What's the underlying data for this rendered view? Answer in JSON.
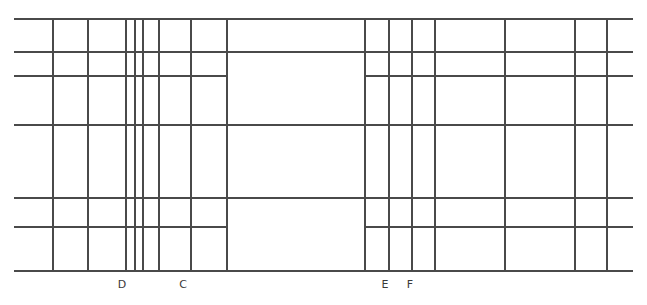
{
  "figure": {
    "width": 647,
    "height": 305,
    "background_color": "#ffffff",
    "line_color": "#4a4a4a",
    "line_color_light": "#6e6e6e",
    "label_color": "#3a3a3a"
  },
  "chart_data": {
    "type": "diagram",
    "title": "",
    "xlabel": "",
    "ylabel": "",
    "grid": true,
    "legend": false,
    "xlim": [
      0,
      647
    ],
    "ylim": [
      0,
      305
    ],
    "horizontal_lines": [
      {
        "id": "h1",
        "y": 19,
        "x_start": 14,
        "x_end": 633,
        "weight": 1.1
      },
      {
        "id": "h2",
        "y": 52,
        "x_start": 14,
        "x_end": 633,
        "weight": 1.1
      },
      {
        "id": "h3",
        "y": 76,
        "x_start": 14,
        "x_end": 227,
        "weight": 1.1
      },
      {
        "id": "h4",
        "y": 76,
        "x_start": 365,
        "x_end": 633,
        "weight": 1.1
      },
      {
        "id": "h5",
        "y": 125,
        "x_start": 14,
        "x_end": 633,
        "weight": 1.1
      },
      {
        "id": "h6",
        "y": 198,
        "x_start": 14,
        "x_end": 633,
        "weight": 1.1
      },
      {
        "id": "h7",
        "y": 227,
        "x_start": 14,
        "x_end": 227,
        "weight": 1.1
      },
      {
        "id": "h8",
        "y": 227,
        "x_start": 365,
        "x_end": 633,
        "weight": 1.1
      },
      {
        "id": "h9",
        "y": 271,
        "x_start": 14,
        "x_end": 633,
        "weight": 1.1
      }
    ],
    "vertical_lines": [
      {
        "id": "v1",
        "x": 53,
        "y_start": 19,
        "y_end": 271,
        "weight": 1.1
      },
      {
        "id": "v2",
        "x": 88,
        "y_start": 19,
        "y_end": 271,
        "weight": 1.1
      },
      {
        "id": "v3",
        "x": 126,
        "y_start": 19,
        "y_end": 271,
        "weight": 1.1
      },
      {
        "id": "v4",
        "x": 135,
        "y_start": 19,
        "y_end": 271,
        "weight": 1.1
      },
      {
        "id": "v5",
        "x": 143,
        "y_start": 19,
        "y_end": 271,
        "weight": 1.1
      },
      {
        "id": "v6",
        "x": 159,
        "y_start": 19,
        "y_end": 271,
        "weight": 1.1
      },
      {
        "id": "v7",
        "x": 191,
        "y_start": 19,
        "y_end": 271,
        "weight": 1.1
      },
      {
        "id": "v8",
        "x": 227,
        "y_start": 19,
        "y_end": 271,
        "weight": 1.1
      },
      {
        "id": "v9",
        "x": 365,
        "y_start": 19,
        "y_end": 271,
        "weight": 1.1
      },
      {
        "id": "v10",
        "x": 389,
        "y_start": 19,
        "y_end": 271,
        "weight": 1.1
      },
      {
        "id": "v11",
        "x": 412,
        "y_start": 19,
        "y_end": 271,
        "weight": 1.1
      },
      {
        "id": "v12",
        "x": 435,
        "y_start": 19,
        "y_end": 271,
        "weight": 1.1
      },
      {
        "id": "v13",
        "x": 505,
        "y_start": 19,
        "y_end": 271,
        "weight": 1.1
      },
      {
        "id": "v14",
        "x": 575,
        "y_start": 19,
        "y_end": 271,
        "weight": 1.1
      },
      {
        "id": "v15",
        "x": 607,
        "y_start": 19,
        "y_end": 271,
        "weight": 1.1
      }
    ],
    "annotations": [
      {
        "id": "label-d",
        "text": "D",
        "x": 122,
        "y": 288,
        "ref_line": "v3"
      },
      {
        "id": "label-c",
        "text": "C",
        "x": 183,
        "y": 288,
        "ref_line": "v7"
      },
      {
        "id": "label-e",
        "text": "E",
        "x": 385,
        "y": 288,
        "ref_line": "v9"
      },
      {
        "id": "label-f",
        "text": "F",
        "x": 410,
        "y": 288,
        "ref_line": "v11"
      }
    ]
  }
}
